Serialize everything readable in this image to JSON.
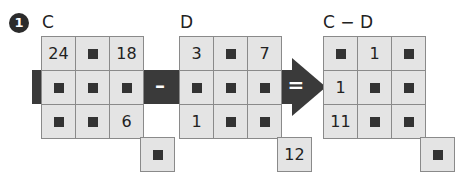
{
  "problem": {
    "number": "1"
  },
  "labels": {
    "c": "C",
    "d": "D",
    "result": "C − D"
  },
  "operators": {
    "minus": "–",
    "equals": "="
  },
  "grids": {
    "c": [
      [
        "24",
        "■",
        "18"
      ],
      [
        "■",
        "■",
        "■"
      ],
      [
        "■",
        "■",
        "6"
      ]
    ],
    "d": [
      [
        "3",
        "■",
        "7"
      ],
      [
        "■",
        "■",
        "■"
      ],
      [
        "1",
        "■",
        "■"
      ]
    ],
    "result": [
      [
        "■",
        "1",
        "■"
      ],
      [
        "1",
        "■",
        "■"
      ],
      [
        "11",
        "■",
        "■"
      ]
    ]
  },
  "extra_cells": {
    "c": "■",
    "d": "12",
    "result": "■"
  },
  "colors": {
    "band": "#3a3a3a",
    "cell": "#e4e4e4",
    "border": "#8a8a8a"
  }
}
